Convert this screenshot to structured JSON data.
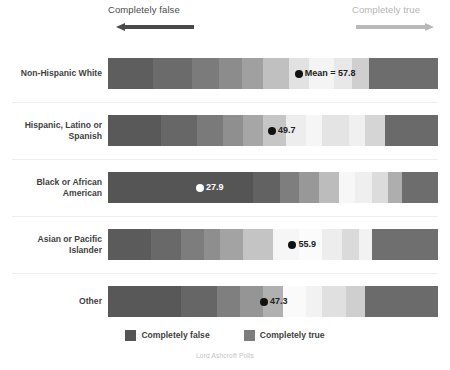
{
  "header": {
    "false_anchor_label": "Completely false",
    "true_anchor_label": "Completely true",
    "false_arrow_icon": "arrow-left-icon",
    "true_arrow_icon": "arrow-right-icon",
    "false_arrow_color": "#4a4a4a",
    "true_arrow_color": "#b9b9b9"
  },
  "legend": {
    "items": [
      {
        "label": "Completely false",
        "color": "#555555",
        "swatch_icon": "legend-swatch-false"
      },
      {
        "label": "Completely true",
        "color": "#7c7c7c",
        "swatch_icon": "legend-swatch-true"
      }
    ]
  },
  "source": {
    "text": "Lord Ashcroft Polls"
  },
  "chart_data": {
    "type": "bar",
    "subtype": "diverging-stacked-likert",
    "title": "",
    "subtitle": "",
    "xlabel": "",
    "ylabel": "",
    "xlim": [
      0,
      100
    ],
    "grid": false,
    "legend_position": "bottom-center",
    "scale_anchors": {
      "low": "Completely false",
      "high": "Completely true"
    },
    "value_label_prefix_first_row": "Mean = ",
    "categories": [
      "Non-Hispanic White",
      "Hispanic, Latino or Spanish",
      "Black or African American",
      "Asian or Pacific Islander",
      "Other"
    ],
    "means": [
      57.8,
      49.7,
      27.9,
      55.9,
      47.3
    ],
    "mean_labels": [
      "Mean = 57.8",
      "49.7",
      "27.9",
      "55.9",
      "47.3"
    ],
    "rows": [
      {
        "category": "Non-Hispanic White",
        "mean": 57.8,
        "mean_label": "Mean = 57.8",
        "marker_dot_color": "#111111",
        "marker_text_color": "#222222",
        "marker_position_pct": 57.8,
        "segments": [
          {
            "width_pct": 13.5,
            "color": "#5e5e5e"
          },
          {
            "width_pct": 12.0,
            "color": "#6b6b6b"
          },
          {
            "width_pct": 8.0,
            "color": "#7b7b7b"
          },
          {
            "width_pct": 7.0,
            "color": "#8c8c8c"
          },
          {
            "width_pct": 6.5,
            "color": "#a0a0a0"
          },
          {
            "width_pct": 8.0,
            "color": "#c0c0c0"
          },
          {
            "width_pct": 6.0,
            "color": "#e2e2e2"
          },
          {
            "width_pct": 7.5,
            "color": "#f4f4f4"
          },
          {
            "width_pct": 5.5,
            "color": "#e8e8e8"
          },
          {
            "width_pct": 5.0,
            "color": "#cfcfcf"
          },
          {
            "width_pct": 21.0,
            "color": "#6d6d6d",
            "hatch": true
          }
        ]
      },
      {
        "category": "Hispanic, Latino or Spanish",
        "mean": 49.7,
        "mean_label": "49.7",
        "marker_dot_color": "#111111",
        "marker_text_color": "#222222",
        "marker_position_pct": 49.7,
        "segments": [
          {
            "width_pct": 16.0,
            "color": "#595959"
          },
          {
            "width_pct": 11.0,
            "color": "#676767"
          },
          {
            "width_pct": 8.0,
            "color": "#7a7a7a"
          },
          {
            "width_pct": 6.0,
            "color": "#8f8f8f"
          },
          {
            "width_pct": 6.0,
            "color": "#a6a6a6"
          },
          {
            "width_pct": 7.0,
            "color": "#c6c6c6"
          },
          {
            "width_pct": 6.0,
            "color": "#ededed"
          },
          {
            "width_pct": 5.0,
            "color": "#f6f6f6"
          },
          {
            "width_pct": 8.0,
            "color": "#e4e4e4"
          },
          {
            "width_pct": 5.0,
            "color": "#f0f0f0"
          },
          {
            "width_pct": 6.0,
            "color": "#d5d5d5"
          },
          {
            "width_pct": 16.0,
            "color": "#6a6a6a",
            "hatch": true
          }
        ]
      },
      {
        "category": "Black or African American",
        "mean": 27.9,
        "mean_label": "27.9",
        "marker_dot_color": "#ffffff",
        "marker_text_color": "#ffffff",
        "marker_position_pct": 27.9,
        "segments": [
          {
            "width_pct": 44.0,
            "color": "#555555"
          },
          {
            "width_pct": 8.0,
            "color": "#626262"
          },
          {
            "width_pct": 6.0,
            "color": "#7e7e7e"
          },
          {
            "width_pct": 6.0,
            "color": "#989898"
          },
          {
            "width_pct": 6.0,
            "color": "#bcbcbc"
          },
          {
            "width_pct": 5.0,
            "color": "#f7f7f7"
          },
          {
            "width_pct": 5.0,
            "color": "#efefef"
          },
          {
            "width_pct": 5.0,
            "color": "#dcdcdc"
          },
          {
            "width_pct": 4.0,
            "color": "#aeaeae"
          },
          {
            "width_pct": 11.0,
            "color": "#6d6d6d",
            "hatch": true
          }
        ]
      },
      {
        "category": "Asian or Pacific Islander",
        "mean": 55.9,
        "mean_label": "55.9",
        "marker_dot_color": "#111111",
        "marker_text_color": "#222222",
        "marker_position_pct": 55.9,
        "segments": [
          {
            "width_pct": 13.0,
            "color": "#5b5b5b"
          },
          {
            "width_pct": 9.0,
            "color": "#696969"
          },
          {
            "width_pct": 7.0,
            "color": "#7d7d7d"
          },
          {
            "width_pct": 5.0,
            "color": "#8e8e8e"
          },
          {
            "width_pct": 7.0,
            "color": "#a3a3a3"
          },
          {
            "width_pct": 9.0,
            "color": "#c4c4c4"
          },
          {
            "width_pct": 8.0,
            "color": "#f6f6f6"
          },
          {
            "width_pct": 7.0,
            "color": "#fbfbfb"
          },
          {
            "width_pct": 6.0,
            "color": "#ededed"
          },
          {
            "width_pct": 5.0,
            "color": "#dadada"
          },
          {
            "width_pct": 4.0,
            "color": "#f2f2f2"
          },
          {
            "width_pct": 20.0,
            "color": "#6f6f6f",
            "hatch": true
          }
        ]
      },
      {
        "category": "Other",
        "mean": 47.3,
        "mean_label": "47.3",
        "marker_dot_color": "#111111",
        "marker_text_color": "#222222",
        "marker_position_pct": 47.3,
        "segments": [
          {
            "width_pct": 22.0,
            "color": "#585858"
          },
          {
            "width_pct": 11.0,
            "color": "#666666"
          },
          {
            "width_pct": 7.0,
            "color": "#7f7f7f"
          },
          {
            "width_pct": 7.0,
            "color": "#959595"
          },
          {
            "width_pct": 6.0,
            "color": "#b0b0b0"
          },
          {
            "width_pct": 7.0,
            "color": "#fafafa"
          },
          {
            "width_pct": 5.0,
            "color": "#f2f2f2"
          },
          {
            "width_pct": 7.0,
            "color": "#e0e0e0"
          },
          {
            "width_pct": 6.0,
            "color": "#cfcfcf"
          },
          {
            "width_pct": 22.0,
            "color": "#6b6b6b",
            "hatch": true
          }
        ]
      }
    ]
  }
}
